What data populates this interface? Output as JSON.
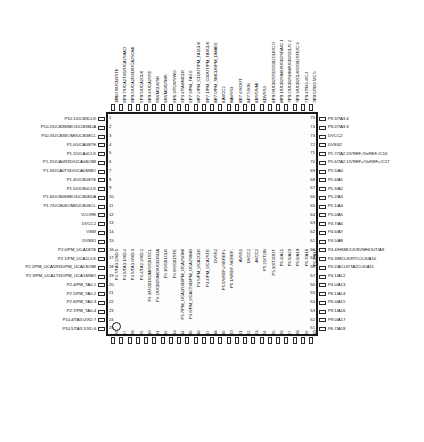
{
  "diagram": {
    "package": "100-pin QFP",
    "caption": "",
    "pin_count": 100,
    "orientation": "top-view"
  },
  "pins": {
    "left": [
      {
        "num": "1",
        "label": "P10.1/UCB3CLK"
      },
      {
        "num": "2",
        "label": "P10.2/UCB3SIMO/UCB3SDA"
      },
      {
        "num": "3",
        "label": "P10.3/UCB3SOMI/UCB3SCL"
      },
      {
        "num": "4",
        "label": "P1.0/UCA0STE"
      },
      {
        "num": "5",
        "label": "P1.1/UCA0CLK"
      },
      {
        "num": "6",
        "label": "P1.2/UCA0RXD/UCA0SOMI"
      },
      {
        "num": "7",
        "label": "P1.3/UCA0TXD/UCA0SIMO"
      },
      {
        "num": "8",
        "label": "P1.4/UCB0STE"
      },
      {
        "num": "9",
        "label": "P1.5/UCB0CLK"
      },
      {
        "num": "10",
        "label": "P1.6/UCB0SIMO/UCB0SDA"
      },
      {
        "num": "11",
        "label": "P1.7/UCB0SOMI/UCB0SCL"
      },
      {
        "num": "12",
        "label": "VCORE"
      },
      {
        "num": "13",
        "label": "DVCC1"
      },
      {
        "num": "14",
        "label": "VSW"
      },
      {
        "num": "15",
        "label": "DVSS1"
      },
      {
        "num": "16",
        "label": "P2.0/PM_UCA1STE"
      },
      {
        "num": "17",
        "label": "P2.1/PM_UCA1CLK"
      },
      {
        "num": "18",
        "label": "P2.2/PM_UCA1RXD/PM_UCA1SOMI"
      },
      {
        "num": "19",
        "label": "P2.3/PM_UCA1TXD/PM_UCA1SIMO"
      },
      {
        "num": "20",
        "label": "P2.4/PM_TA0.1"
      },
      {
        "num": "21",
        "label": "P2.5/PM_TA0.2"
      },
      {
        "num": "22",
        "label": "P2.6/PM_TA0.3"
      },
      {
        "num": "23",
        "label": "P2.7/PM_TA0.4"
      },
      {
        "num": "24",
        "label": "P10.4/TA3.0/XD.7"
      },
      {
        "num": "25",
        "label": "P10.5/TA3.1/XD.6"
      }
    ],
    "bottom": [
      {
        "num": "26",
        "label": "P4.7/TA3.2/XD.5"
      },
      {
        "num": "27",
        "label": "P4.6/TA3.1/XD.4"
      },
      {
        "num": "28",
        "label": "P4.5/TA3.0/XD.3"
      },
      {
        "num": "29",
        "label": "P4.4/TA2.2/XD.2"
      },
      {
        "num": "30",
        "label": "P4.3/UCB1SOMI/UCB1SCL"
      },
      {
        "num": "31",
        "label": "P4.2/UCB1SIMO/UCB1SDA"
      },
      {
        "num": "32",
        "label": "P4.1/UCB1CLK"
      },
      {
        "num": "33",
        "label": "P4.0/UCB1STE"
      },
      {
        "num": "34",
        "label": "P3.7/PM_UCA2RXD/PM_UCA2SOMI"
      },
      {
        "num": "35",
        "label": "P3.6/PM_UCA2TXD/PM_UCA2SIMO"
      },
      {
        "num": "36",
        "label": "P3.5/PM_UCA2CLK"
      },
      {
        "num": "37",
        "label": "P3.4/PM_UCA2STE"
      },
      {
        "num": "38",
        "label": "DVSS2"
      },
      {
        "num": "39",
        "label": "P5.0/VREF+/VEREF+"
      },
      {
        "num": "40",
        "label": "P5.1/VREF-/VEREF-"
      },
      {
        "num": "41",
        "label": "AVSS1"
      },
      {
        "num": "42",
        "label": "DVCC2"
      },
      {
        "num": "43",
        "label": "AVCC2"
      },
      {
        "num": "44",
        "label": "P5.2/XT2IN"
      },
      {
        "num": "45",
        "label": "P5.3/XT2OUT"
      },
      {
        "num": "46",
        "label": "P6.4/A21"
      },
      {
        "num": "47",
        "label": "P6.5/A20"
      },
      {
        "num": "48",
        "label": "P6.6/A19"
      },
      {
        "num": "49",
        "label": "P6.7/A18"
      },
      {
        "num": "50",
        "label": "P6.0/A17"
      }
    ],
    "right": [
      {
        "num": "75",
        "label": "P9.3/TA3.4"
      },
      {
        "num": "74",
        "label": "P9.2/TA3.3"
      },
      {
        "num": "73",
        "label": "DVCC2"
      },
      {
        "num": "72",
        "label": "DVSS2"
      },
      {
        "num": "71",
        "label": "P5.7/TA2.2/VREF-/VeREF-/C16"
      },
      {
        "num": "70",
        "label": "P5.6/TA2.1/VREF+/VeREF+/C17"
      },
      {
        "num": "69",
        "label": "P5.5/A0"
      },
      {
        "num": "68",
        "label": "P5.4/A1"
      },
      {
        "num": "67",
        "label": "P5.3/A2"
      },
      {
        "num": "66",
        "label": "P5.2/A3"
      },
      {
        "num": "65",
        "label": "P5.1/A4"
      },
      {
        "num": "64",
        "label": "P5.0/A5"
      },
      {
        "num": "63",
        "label": "P4.7/A6"
      },
      {
        "num": "62",
        "label": "P4.6/A7"
      },
      {
        "num": "61",
        "label": "P4.5/A8"
      },
      {
        "num": "60",
        "label": "P4.4/HSMCLK/SVMHOUT/A9"
      },
      {
        "num": "59",
        "label": "P4.3/MCLK/RTCCLK/A10"
      },
      {
        "num": "58",
        "label": "P4.2/ACLK/TA2CLK/A11"
      },
      {
        "num": "57",
        "label": "P4.1/A12"
      },
      {
        "num": "56",
        "label": "P4.0/A13"
      },
      {
        "num": "55",
        "label": "P6.1/A14"
      },
      {
        "num": "54",
        "label": "P6.0/A15"
      },
      {
        "num": "53",
        "label": "P9.1/A16"
      },
      {
        "num": "52",
        "label": "P9.0/A17"
      },
      {
        "num": "51",
        "label": "P6.7/A18"
      }
    ],
    "top": [
      {
        "num": "100",
        "label": "P10.0/UCB3STE"
      },
      {
        "num": "99",
        "label": "P9.7/UCA2TXD/UCA2SIMO"
      },
      {
        "num": "98",
        "label": "P9.6/UCA2RXD/UCA2SOMI"
      },
      {
        "num": "97",
        "label": "P9.5/UCA2CLK"
      },
      {
        "num": "96",
        "label": "P9.4/UCA2STE"
      },
      {
        "num": "95",
        "label": "SVMCLK/SK"
      },
      {
        "num": "94",
        "label": "SVMO/DTMS"
      },
      {
        "num": "93",
        "label": "P8.3/TCK/SWO"
      },
      {
        "num": "92",
        "label": "P3.4/TA0/MCLK"
      },
      {
        "num": "91",
        "label": "P7.3/PM_TA0.0"
      },
      {
        "num": "90",
        "label": "P7.2/PM_C1OUT/PM_TA1CLK"
      },
      {
        "num": "89",
        "label": "P7.1/PM_C0OUT/PM_TA0CLK"
      },
      {
        "num": "88",
        "label": "P7.0/PM_SMCLK/PM_DMAE0"
      },
      {
        "num": "87",
        "label": "AVCC2"
      },
      {
        "num": "86",
        "label": "AVSS3"
      },
      {
        "num": "85",
        "label": "P7.4/XOUT"
      },
      {
        "num": "84",
        "label": "P7.5/XIN"
      },
      {
        "num": "83",
        "label": "RST/NMI"
      },
      {
        "num": "82",
        "label": "DVSS3"
      },
      {
        "num": "81",
        "label": "P9.0/UCB2STE/UCB2CLK/C.0"
      },
      {
        "num": "80",
        "label": "P9.1/UCB2SIMO/UCB2SDA/C.1"
      },
      {
        "num": "79",
        "label": "P9.2/UCB2SOMI/UCB2SCL/C.2"
      },
      {
        "num": "78",
        "label": "P9.3/UCB2CLK/UCB2STE/C.3"
      },
      {
        "num": "77",
        "label": "P9.4/TB3.4/C.4"
      },
      {
        "num": "76",
        "label": "P9.5/TB3.5/C.5"
      }
    ]
  }
}
